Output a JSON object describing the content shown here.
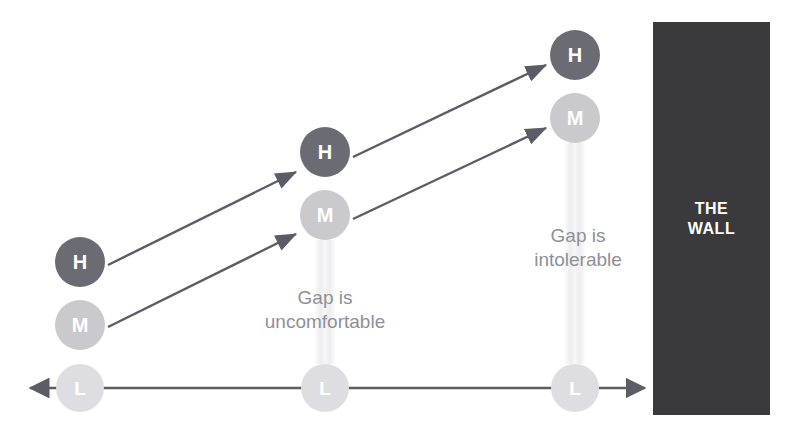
{
  "diagram": {
    "title_text": "",
    "background_color": "#ffffff",
    "colors": {
      "high_node": "#6b6b73",
      "medium_node": "#c9c9ce",
      "low_node": "#dedee2",
      "arrow": "#5c5c66",
      "axis": "#5c5c66",
      "wall_fill": "#3a3a3c",
      "wall_text": "#ffffff",
      "gap_label_text": "#8f8f97",
      "node_text": "#ffffff"
    },
    "nodes": [
      {
        "id": "h1",
        "label": "H",
        "tier": "high",
        "x": 80,
        "y": 262,
        "r": 25
      },
      {
        "id": "m1",
        "label": "M",
        "tier": "medium",
        "x": 80,
        "y": 325,
        "r": 25
      },
      {
        "id": "l1",
        "label": "L",
        "tier": "low",
        "x": 80,
        "y": 388,
        "r": 24
      },
      {
        "id": "h2",
        "label": "H",
        "tier": "high",
        "x": 325,
        "y": 152,
        "r": 25
      },
      {
        "id": "m2",
        "label": "M",
        "tier": "medium",
        "x": 325,
        "y": 215,
        "r": 25
      },
      {
        "id": "l2",
        "label": "L",
        "tier": "low",
        "x": 325,
        "y": 388,
        "r": 24
      },
      {
        "id": "h3",
        "label": "H",
        "tier": "high",
        "x": 575,
        "y": 55,
        "r": 25
      },
      {
        "id": "m3",
        "label": "M",
        "tier": "medium",
        "x": 575,
        "y": 118,
        "r": 25
      },
      {
        "id": "l3",
        "label": "L",
        "tier": "low",
        "x": 575,
        "y": 388,
        "r": 24
      }
    ],
    "arrows": [
      {
        "id": "a1",
        "from": "h1",
        "to": "h2",
        "x1": 108,
        "y1": 265,
        "x2": 296,
        "y2": 172
      },
      {
        "id": "a2",
        "from": "m1",
        "to": "m2",
        "x1": 108,
        "y1": 327,
        "x2": 296,
        "y2": 234
      },
      {
        "id": "a3",
        "from": "h2",
        "to": "h3",
        "x1": 353,
        "y1": 157,
        "x2": 546,
        "y2": 65
      },
      {
        "id": "a4",
        "from": "m2",
        "to": "m3",
        "x1": 353,
        "y1": 219,
        "x2": 546,
        "y2": 128
      }
    ],
    "gap_labels": [
      {
        "id": "gap-uncomfortable",
        "text": "Gap is\nuncomfortable",
        "x": 325,
        "y": 310
      },
      {
        "id": "gap-intolerable",
        "text": "Gap is\nintolerable",
        "x": 578,
        "y": 248
      }
    ],
    "gap_bands": [
      {
        "id": "band-middle",
        "x": 325,
        "top": 240,
        "bottom": 364,
        "width": 22
      },
      {
        "id": "band-right",
        "x": 575,
        "top": 143,
        "bottom": 364,
        "width": 22
      }
    ],
    "axis": {
      "id": "baseline-axis",
      "y": 388,
      "x_start": 30,
      "x_end": 645,
      "double_headed": true
    },
    "wall": {
      "label": "THE\nWALL",
      "x": 653,
      "y": 22,
      "width": 117,
      "height": 393
    }
  }
}
